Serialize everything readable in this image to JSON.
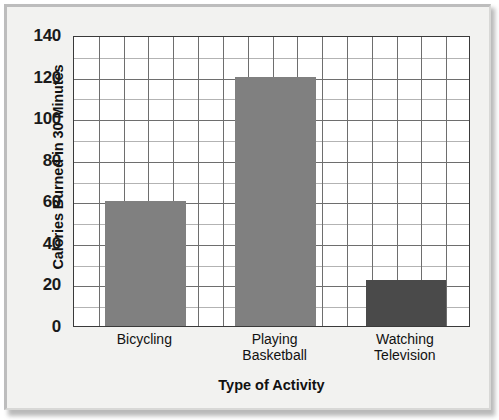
{
  "chart_data": {
    "type": "bar",
    "title": "",
    "subtitle": "",
    "xlabel": "Type of Activity",
    "ylabel": "Calories Burned in 30 Minutes",
    "categories": [
      "Bicycling",
      "Playing Basketball",
      "Watching Television"
    ],
    "category_lines": [
      [
        "Bicycling"
      ],
      [
        "Playing",
        "Basketball"
      ],
      [
        "Watching",
        "Television"
      ]
    ],
    "values": [
      60,
      120,
      22
    ],
    "bar_colors": [
      "#808080",
      "#808080",
      "#4a4a4a"
    ],
    "ylim": [
      0,
      140
    ],
    "xlim": [
      0,
      16
    ],
    "y_major_ticks": [
      0,
      20,
      40,
      60,
      80,
      100,
      120,
      140
    ],
    "y_minor_step": 10,
    "y_tick_labels": [
      "0",
      "20",
      "40",
      "60",
      "80",
      "100",
      "120",
      "140"
    ],
    "grid": true,
    "grid_columns": 16,
    "legend": "none",
    "bar_columns": [
      {
        "start_column": 1.25,
        "end_column": 4.5
      },
      {
        "start_column": 6.5,
        "end_column": 9.75
      },
      {
        "start_column": 11.75,
        "end_column": 15.0
      }
    ],
    "colors": {
      "plot_background": "#ffffff",
      "figure_background": "#f2f2f0",
      "axis": "#3a3a3a",
      "gridline_major": "#6e6e6e",
      "gridline_minor": "#b3b3b3",
      "text": "#111111"
    }
  }
}
